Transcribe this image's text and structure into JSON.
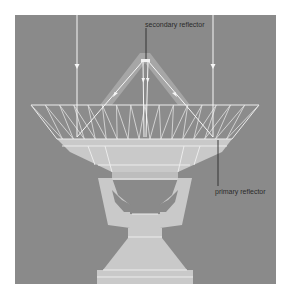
{
  "diagram": {
    "labels": {
      "secondary": "secondary reflector",
      "primary": "primary reflector"
    },
    "colors": {
      "background": "#8a8a8a",
      "structure": "#c9c9c9",
      "rays": "#f6f6f6",
      "label_text": "#2a2a2a"
    }
  }
}
